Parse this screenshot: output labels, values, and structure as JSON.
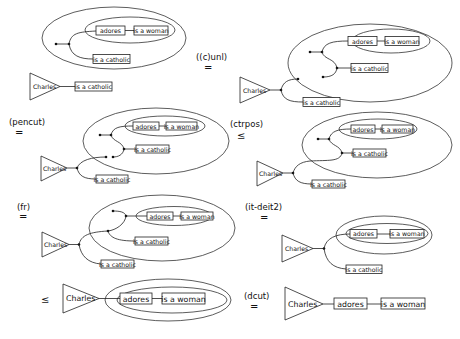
{
  "diagram": {
    "labels": {
      "subject": "Charles",
      "relation": "adores",
      "predicate_woman": "is a woman",
      "predicate_catholic": "is a catholic"
    },
    "steps": [
      {
        "id": "step-1",
        "rule": "",
        "relation": ""
      },
      {
        "id": "step-2",
        "rule": "((c)unl)",
        "relation": "="
      },
      {
        "id": "step-3",
        "rule": "(pencut)",
        "relation": "="
      },
      {
        "id": "step-4",
        "rule": "(ctrpos)",
        "relation": "≤"
      },
      {
        "id": "step-5",
        "rule": "(fr)",
        "relation": "="
      },
      {
        "id": "step-6",
        "rule": "(it-deit2)",
        "relation": "="
      },
      {
        "id": "step-7",
        "rule": "",
        "relation": "≤"
      },
      {
        "id": "step-8",
        "rule": "(dcut)",
        "relation": "="
      }
    ]
  }
}
